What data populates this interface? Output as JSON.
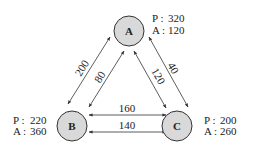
{
  "diagram": {
    "nodes": [
      {
        "id": "A",
        "label": "A",
        "p_label": "P :",
        "p_value": "320",
        "a_label": "A :",
        "a_value": "120"
      },
      {
        "id": "B",
        "label": "B",
        "p_label": "P :",
        "p_value": "220",
        "a_label": "A :",
        "a_value": "360"
      },
      {
        "id": "C",
        "label": "C",
        "p_label": "P :",
        "p_value": "200",
        "a_label": "A :",
        "a_value": "260"
      }
    ],
    "edges": [
      {
        "from": "A",
        "to": "B",
        "position": "outer",
        "weight": "200"
      },
      {
        "from": "A",
        "to": "B",
        "position": "inner",
        "weight": "80"
      },
      {
        "from": "A",
        "to": "C",
        "position": "inner",
        "weight": "120"
      },
      {
        "from": "A",
        "to": "C",
        "position": "outer",
        "weight": "40"
      },
      {
        "from": "B",
        "to": "C",
        "position": "upper",
        "weight": "160"
      },
      {
        "from": "B",
        "to": "C",
        "position": "lower",
        "weight": "140"
      }
    ],
    "colors": {
      "node_fill": "#d9d9d9",
      "stroke": "#333333"
    }
  }
}
